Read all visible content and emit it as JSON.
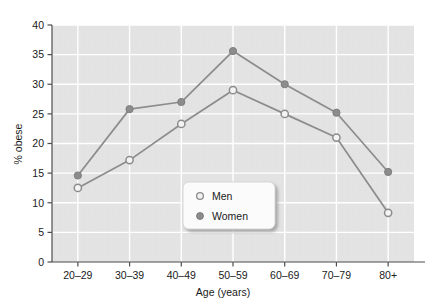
{
  "chart_data": {
    "type": "line",
    "title": "",
    "subtitle": "",
    "xlabel": "Age (years)",
    "ylabel": "% obese",
    "categories": [
      "20–29",
      "30–39",
      "40–49",
      "50–59",
      "60–69",
      "70–79",
      "80+"
    ],
    "series": [
      {
        "name": "Men",
        "marker": "open-circle",
        "color": "#8c8c8c",
        "values": [
          12.5,
          17.2,
          23.3,
          29.0,
          25.0,
          21.0,
          8.3
        ]
      },
      {
        "name": "Women",
        "marker": "filled-circle",
        "color": "#8c8c8c",
        "values": [
          14.6,
          25.8,
          27.0,
          35.6,
          30.0,
          25.2,
          15.2
        ]
      }
    ],
    "ylim": [
      0,
      40
    ],
    "yticks": [
      0,
      5,
      10,
      15,
      20,
      25,
      30,
      35,
      40
    ],
    "ytick_labels": [
      "0",
      "5",
      "10",
      "15",
      "20",
      "25",
      "30",
      "35",
      "40"
    ],
    "grid": "horizontal-and-vertical-white-on-gray",
    "legend_position": "center",
    "plot_background": "#e3e3e3",
    "gridline_color": "#ffffff",
    "axis_color": "#4d4d4d"
  },
  "legend": {
    "entries": [
      {
        "label": "Men",
        "marker": "open-circle"
      },
      {
        "label": "Women",
        "marker": "filled-circle"
      }
    ]
  },
  "axes": {
    "y_title": "% obese",
    "x_title": "Age (years)"
  }
}
